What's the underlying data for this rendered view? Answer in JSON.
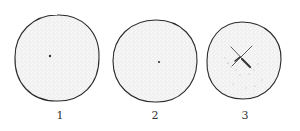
{
  "figure": {
    "colors": {
      "outline": "#2a2a2a",
      "stipple": "#9a9a9a",
      "fill": "#f4f4f4",
      "mark": "#333333"
    },
    "panels": [
      {
        "label": "1",
        "cx": 57,
        "cy": 58,
        "rx": 42,
        "ry": 43,
        "marker": "dot"
      },
      {
        "label": "2",
        "cx": 155,
        "cy": 61,
        "rx": 42,
        "ry": 41,
        "marker": "dot"
      },
      {
        "label": "3",
        "cx": 244,
        "cy": 61,
        "rx": 37,
        "ry": 39,
        "marker": "cross"
      }
    ]
  }
}
